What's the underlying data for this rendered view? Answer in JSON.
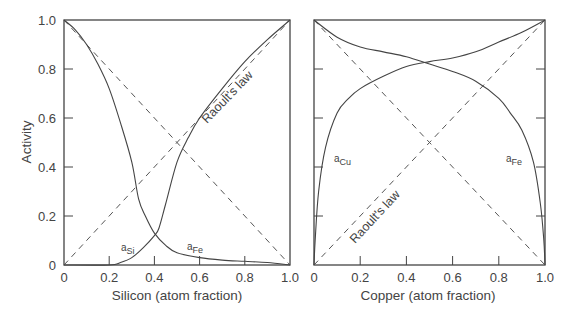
{
  "chart_data": [
    {
      "type": "line",
      "title": "",
      "xlabel": "Silicon (atom fraction)",
      "ylabel": "Activity",
      "xlim": [
        0,
        1
      ],
      "ylim": [
        0,
        1
      ],
      "xticks": [
        "0",
        "0.2",
        "0.4",
        "0.6",
        "0.8",
        "1.0"
      ],
      "yticks": [
        "0",
        "0.2",
        "0.4",
        "0.6",
        "0.8",
        "1.0"
      ],
      "grid": false,
      "annotation": "Raoult's law",
      "series": [
        {
          "name": "a_Si",
          "label_main": "a",
          "label_sub": "Si",
          "x": [
            0,
            0.2,
            0.25,
            0.3,
            0.35,
            0.4,
            0.42,
            0.45,
            0.5,
            0.55,
            0.6,
            0.7,
            0.8,
            0.9,
            1.0
          ],
          "y": [
            0,
            0,
            0.01,
            0.03,
            0.07,
            0.12,
            0.15,
            0.25,
            0.42,
            0.52,
            0.6,
            0.72,
            0.83,
            0.92,
            1.0
          ]
        },
        {
          "name": "a_Fe",
          "label_main": "a",
          "label_sub": "Fe",
          "x": [
            0,
            0.05,
            0.1,
            0.15,
            0.2,
            0.25,
            0.3,
            0.33,
            0.36,
            0.4,
            0.45,
            0.5,
            0.6,
            0.7,
            0.8,
            0.9,
            1.0
          ],
          "y": [
            1.0,
            0.96,
            0.9,
            0.82,
            0.72,
            0.58,
            0.42,
            0.27,
            0.2,
            0.13,
            0.08,
            0.05,
            0.03,
            0.02,
            0.015,
            0.01,
            0
          ]
        },
        {
          "name": "Raoult a_Si",
          "style": "dashed",
          "x": [
            0,
            1
          ],
          "y": [
            0,
            1
          ]
        },
        {
          "name": "Raoult a_Fe",
          "style": "dashed",
          "x": [
            0,
            1
          ],
          "y": [
            1,
            0
          ]
        }
      ]
    },
    {
      "type": "line",
      "title": "",
      "xlabel": "Copper (atom fraction)",
      "ylabel": "",
      "xlim": [
        0,
        1
      ],
      "ylim": [
        0,
        1
      ],
      "xticks": [
        "0",
        "0.2",
        "0.4",
        "0.6",
        "0.8",
        "1.0"
      ],
      "grid": false,
      "annotation": "Raoult's law",
      "series": [
        {
          "name": "a_Cu",
          "label_main": "a",
          "label_sub": "Cu",
          "x": [
            0,
            0.005,
            0.02,
            0.05,
            0.1,
            0.15,
            0.2,
            0.3,
            0.4,
            0.5,
            0.6,
            0.7,
            0.8,
            0.9,
            1.0
          ],
          "y": [
            0,
            0.1,
            0.3,
            0.48,
            0.62,
            0.68,
            0.72,
            0.77,
            0.81,
            0.83,
            0.845,
            0.87,
            0.91,
            0.95,
            1.0
          ]
        },
        {
          "name": "a_Fe",
          "label_main": "a",
          "label_sub": "Fe",
          "x": [
            0,
            0.1,
            0.2,
            0.3,
            0.4,
            0.5,
            0.6,
            0.7,
            0.8,
            0.85,
            0.9,
            0.95,
            0.98,
            0.995,
            1.0
          ],
          "y": [
            1.0,
            0.93,
            0.89,
            0.87,
            0.85,
            0.82,
            0.79,
            0.75,
            0.68,
            0.62,
            0.55,
            0.42,
            0.25,
            0.1,
            0
          ]
        },
        {
          "name": "Raoult a_Cu",
          "style": "dashed",
          "x": [
            0,
            1
          ],
          "y": [
            0,
            1
          ]
        },
        {
          "name": "Raoult a_Fe",
          "style": "dashed",
          "x": [
            0,
            1
          ],
          "y": [
            1,
            0
          ]
        }
      ]
    }
  ]
}
